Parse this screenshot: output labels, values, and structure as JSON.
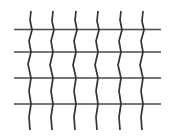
{
  "figure": {
    "type": "line-drawing",
    "width": 175,
    "height": 137,
    "background_color": "#ffffff",
    "line_color": "#3a3a3a",
    "horizontal_line_color": "#4a4a4a",
    "vertical_line_color": "#333333",
    "horizontal_line_width": 1.6,
    "vertical_line_width": 1.7,
    "horizontal_line_count": 4,
    "vertical_line_count": 6,
    "horizontal_extent": {
      "x_start": 14,
      "x_end": 161
    },
    "vertical_extent": {
      "y_start": 11,
      "y_end": 130
    },
    "horizontal_lines": [
      {
        "name": "horizontal-line-1",
        "y": 29.5
      },
      {
        "name": "horizontal-line-2",
        "y": 52.0
      },
      {
        "name": "horizontal-line-3",
        "y": 78.0
      },
      {
        "name": "horizontal-line-4",
        "y": 104.0
      }
    ],
    "vertical_lines": [
      {
        "name": "vertical-line-1",
        "points": "31,11 30,20 32,30 29,41 31,52 28,64 31,78 29,91 31,104 29,117 30,130"
      },
      {
        "name": "vertical-line-2",
        "points": "53,11 52,21 54,30 51,41 53,52 50,65 53,78 51,91 53,104 51,117 52,130"
      },
      {
        "name": "vertical-line-3",
        "points": "76,11 75,20 77,30 74,41 76,52 73,65 76,78 74,91 76,104 74,117 75,130"
      },
      {
        "name": "vertical-line-4",
        "points": "98,11 97,21 99,30 96,41 98,52 95,65 98,78 96,91 98,104 96,117 97,130"
      },
      {
        "name": "vertical-line-5",
        "points": "121,11 120,20 122,30 119,41 121,52 118,65 121,78 119,91 121,104 119,117 120,130"
      },
      {
        "name": "vertical-line-6",
        "points": "143,11 142,21 144,30 141,41 143,52 140,65 143,78 141,91 143,104 141,117 142,130"
      }
    ]
  }
}
